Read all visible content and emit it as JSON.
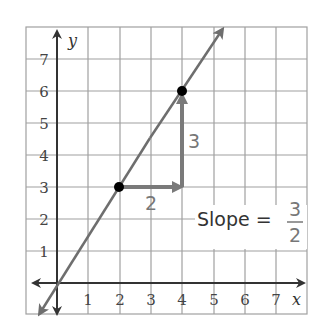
{
  "graph": {
    "x_axis_label": "x",
    "y_axis_label": "y",
    "x_ticks": [
      "1",
      "2",
      "3",
      "4",
      "5",
      "6",
      "7"
    ],
    "y_ticks": [
      "1",
      "2",
      "3",
      "4",
      "5",
      "6",
      "7"
    ],
    "points": [
      {
        "x": 2,
        "y": 3
      },
      {
        "x": 4,
        "y": 6
      }
    ],
    "run_label": "2",
    "rise_label": "3",
    "slope_text": "Slope =",
    "slope_numerator": "3",
    "slope_denominator": "2",
    "colors": {
      "grid": "#a0a0a0",
      "axis": "#333333",
      "line": "#6e6e6e",
      "arrow": "#7a7a7a",
      "point": "#000000"
    }
  }
}
